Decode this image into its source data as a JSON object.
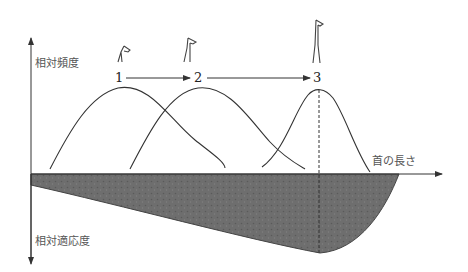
{
  "figure": {
    "y_axis_up_label": "相対頻度",
    "y_axis_down_label": "相対適応度",
    "x_axis_label": "首の長さ",
    "stages": [
      {
        "label": "1",
        "icon": "short-neck-giraffe-icon"
      },
      {
        "label": "2",
        "icon": "medium-neck-giraffe-icon"
      },
      {
        "label": "3",
        "icon": "long-neck-giraffe-icon"
      }
    ],
    "colors": {
      "line": "#333333",
      "fitness_fill": "#6b6b6b",
      "text": "#555555"
    }
  }
}
